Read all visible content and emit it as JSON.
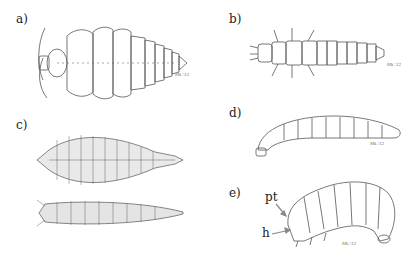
{
  "figure": {
    "panels": [
      {
        "id": "a",
        "label": "a)",
        "description": "Dorsal view of broad, flattened onisciform larva with tapering abdomen",
        "signature": "Mk.'12"
      },
      {
        "id": "b",
        "label": "b)",
        "description": "Dorsal view of elongate campodeiform larva with thoracic legs and lateral processes",
        "signature": "Mk.'12"
      },
      {
        "id": "c",
        "label": "c)",
        "description": "Dorsal and ventral views of stippled, lobed larva (two specimens)",
        "signature": ""
      },
      {
        "id": "d",
        "label": "d)",
        "description": "Lateral view of elongate cylindrical elateriform larva",
        "signature": "Mk.'12"
      },
      {
        "id": "e",
        "label": "e)",
        "description": "Lateral view of C-shaped scarabaeiform larva",
        "signature": "Mk.'12"
      }
    ],
    "annotations": [
      {
        "text": "pt",
        "target": "prothorax",
        "panel": "e"
      },
      {
        "text": "h",
        "target": "head",
        "panel": "e"
      }
    ],
    "colors": {
      "line": "#555555",
      "background": "#ffffff",
      "arrow": "#888888"
    }
  }
}
